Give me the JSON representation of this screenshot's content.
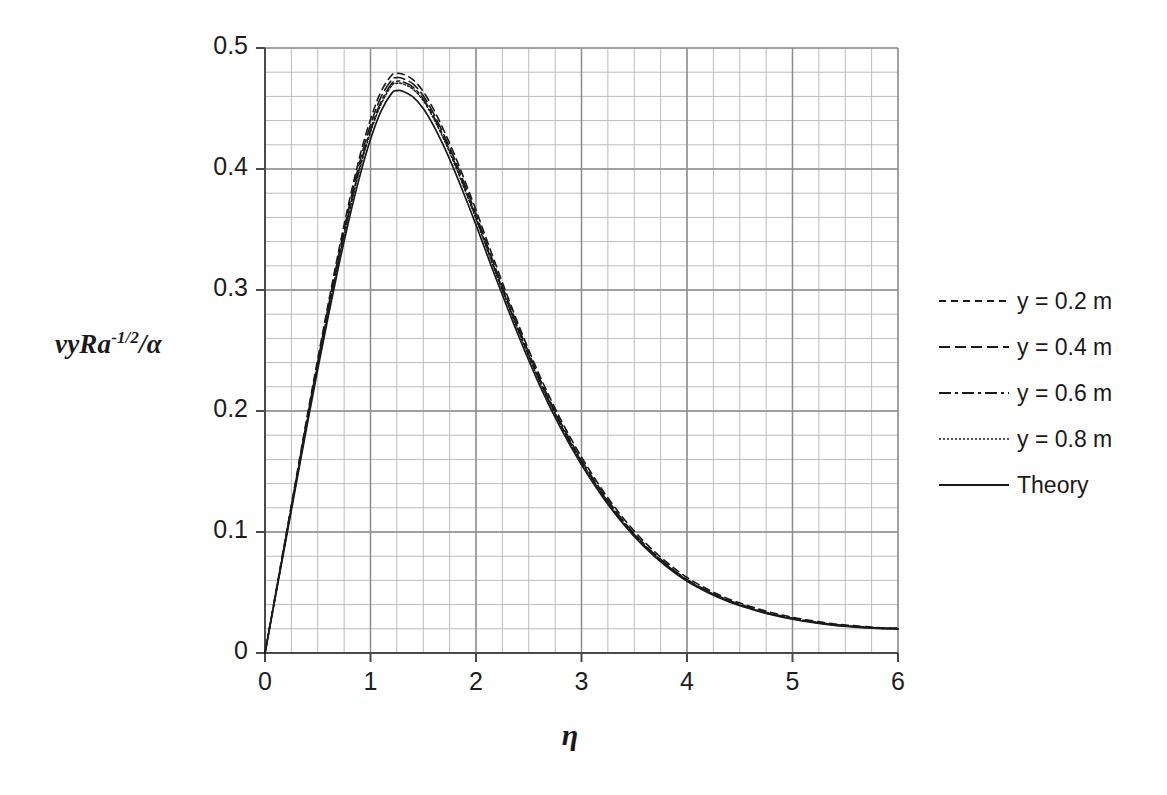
{
  "chart_data": {
    "type": "line",
    "title": "",
    "subtitle": "",
    "xlabel": "η",
    "ylabel_html": "vyRa<sup>-1/2</sup>/α",
    "ylabel_text": "vyRa-1/2/α",
    "xlim": [
      0,
      6
    ],
    "ylim": [
      0,
      0.5
    ],
    "xticks": [
      "0",
      "1",
      "2",
      "3",
      "4",
      "5",
      "6"
    ],
    "xtick_values": [
      0,
      1,
      2,
      3,
      4,
      5,
      6
    ],
    "yticks": [
      "0",
      "0.1",
      "0.2",
      "0.3",
      "0.4",
      "0.5"
    ],
    "ytick_values": [
      0,
      0.1,
      0.2,
      0.3,
      0.4,
      0.5
    ],
    "grid": true,
    "grid_major_color": "#8c8c8c",
    "grid_minor_color": "#bcbcbc",
    "grid_minor_x_step": 0.25,
    "grid_minor_y_step": 0.02,
    "legend_position": "right",
    "line_color": "#1a1a1a",
    "x": [
      0,
      0.1,
      0.2,
      0.3,
      0.4,
      0.5,
      0.6,
      0.7,
      0.8,
      0.9,
      1.0,
      1.1,
      1.2,
      1.25,
      1.3,
      1.4,
      1.5,
      1.6,
      1.7,
      1.8,
      1.9,
      2.0,
      2.2,
      2.4,
      2.6,
      2.8,
      3.0,
      3.2,
      3.4,
      3.6,
      3.8,
      4.0,
      4.2,
      4.4,
      4.6,
      4.8,
      5.0,
      5.2,
      5.4,
      5.6,
      5.8,
      6.0
    ],
    "series": [
      {
        "name": "y = 0.2 m",
        "style": "dashed-short",
        "dasharray": "7,5",
        "width": 1.6,
        "values": [
          0,
          0.049,
          0.098,
          0.147,
          0.196,
          0.243,
          0.289,
          0.333,
          0.374,
          0.411,
          0.441,
          0.464,
          0.4775,
          0.479,
          0.4785,
          0.474,
          0.464,
          0.449,
          0.431,
          0.411,
          0.389,
          0.366,
          0.318,
          0.272,
          0.23,
          0.1935,
          0.162,
          0.1345,
          0.111,
          0.0915,
          0.0755,
          0.0625,
          0.0525,
          0.0445,
          0.0385,
          0.0335,
          0.0295,
          0.0265,
          0.024,
          0.0225,
          0.021,
          0.0205
        ]
      },
      {
        "name": "y = 0.4 m",
        "style": "dashed-long",
        "dasharray": "11,5",
        "width": 1.6,
        "values": [
          0,
          0.0485,
          0.097,
          0.1455,
          0.194,
          0.2405,
          0.286,
          0.3295,
          0.37,
          0.4065,
          0.4365,
          0.4595,
          0.4735,
          0.4755,
          0.475,
          0.4705,
          0.4605,
          0.4455,
          0.4275,
          0.4075,
          0.3855,
          0.3625,
          0.3145,
          0.2695,
          0.2275,
          0.191,
          0.1595,
          0.1325,
          0.109,
          0.0895,
          0.0738,
          0.0608,
          0.0512,
          0.0434,
          0.0375,
          0.0325,
          0.0288,
          0.0258,
          0.0235,
          0.022,
          0.0207,
          0.0202
        ]
      },
      {
        "name": "y = 0.6 m",
        "style": "dash-dot",
        "dasharray": "12,4,3,4",
        "width": 1.6,
        "values": [
          0,
          0.048,
          0.096,
          0.144,
          0.192,
          0.2385,
          0.2835,
          0.3265,
          0.3665,
          0.4025,
          0.4325,
          0.4555,
          0.4705,
          0.4725,
          0.4722,
          0.4678,
          0.458,
          0.443,
          0.425,
          0.405,
          0.383,
          0.36,
          0.3125,
          0.2675,
          0.2258,
          0.1895,
          0.1582,
          0.1313,
          0.1081,
          0.0888,
          0.0732,
          0.0603,
          0.0508,
          0.043,
          0.0372,
          0.0322,
          0.0285,
          0.0256,
          0.0233,
          0.0218,
          0.0206,
          0.0201
        ]
      },
      {
        "name": "y = 0.8 m",
        "style": "dotted",
        "dasharray": "2,2",
        "width": 1.5,
        "values": [
          0,
          0.0478,
          0.0956,
          0.1434,
          0.1912,
          0.2375,
          0.2822,
          0.3252,
          0.3648,
          0.4005,
          0.4305,
          0.4535,
          0.4688,
          0.4708,
          0.4705,
          0.4662,
          0.4565,
          0.4415,
          0.4235,
          0.4035,
          0.3815,
          0.3588,
          0.3112,
          0.2663,
          0.2248,
          0.1886,
          0.1575,
          0.1306,
          0.1075,
          0.0883,
          0.0728,
          0.06,
          0.0505,
          0.0428,
          0.037,
          0.032,
          0.0283,
          0.0254,
          0.0232,
          0.0217,
          0.0205,
          0.02
        ]
      },
      {
        "name": "Theory",
        "style": "solid",
        "dasharray": "",
        "width": 1.7,
        "values": [
          0,
          0.0472,
          0.0944,
          0.1416,
          0.1888,
          0.2345,
          0.2785,
          0.3205,
          0.3595,
          0.3945,
          0.4245,
          0.4478,
          0.4625,
          0.4648,
          0.4645,
          0.4598,
          0.45,
          0.4355,
          0.4178,
          0.3978,
          0.3762,
          0.3538,
          0.3072,
          0.2628,
          0.2218,
          0.1862,
          0.1555,
          0.129,
          0.1062,
          0.0872,
          0.0718,
          0.0592,
          0.0498,
          0.0422,
          0.0365,
          0.0316,
          0.0279,
          0.0251,
          0.0229,
          0.0214,
          0.0203,
          0.0198
        ]
      }
    ]
  },
  "legend": {
    "items": [
      {
        "label": "y = 0.2 m"
      },
      {
        "label": "y = 0.4 m"
      },
      {
        "label": "y = 0.6 m"
      },
      {
        "label": "y = 0.8 m"
      },
      {
        "label": "Theory"
      }
    ]
  }
}
